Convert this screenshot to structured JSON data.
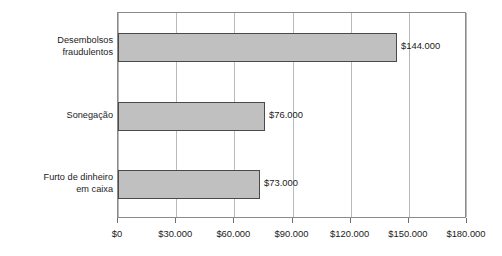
{
  "chart_data": {
    "type": "bar",
    "orientation": "horizontal",
    "title": "",
    "subtitle": "",
    "xlabel": "",
    "ylabel": "",
    "categories": [
      "Desembolsos\nfraudulentos",
      "Sonegação",
      "Furto de dinheiro\nem caixa"
    ],
    "values": [
      144000,
      76000,
      73000
    ],
    "value_labels": [
      "$144.000",
      "$76.000",
      "$73.000"
    ],
    "xlim": [
      0,
      180000
    ],
    "xticks": [
      0,
      30000,
      60000,
      90000,
      120000,
      150000,
      180000
    ],
    "xticklabels": [
      "$0",
      "$30.000",
      "$60.000",
      "$90.000",
      "$120.000",
      "$150.000",
      "$180.000"
    ],
    "grid": "vertical",
    "legend": null,
    "series": [
      {
        "name": "",
        "values": [
          144000,
          76000,
          73000
        ]
      }
    ],
    "colors": {
      "bar_fill": "#c0c0c0",
      "bar_border": "#4a4a4a",
      "gridline": "#b9b9b9",
      "frame": "#8a8a8a",
      "text": "#1a1a1a",
      "background": "#ffffff"
    }
  }
}
